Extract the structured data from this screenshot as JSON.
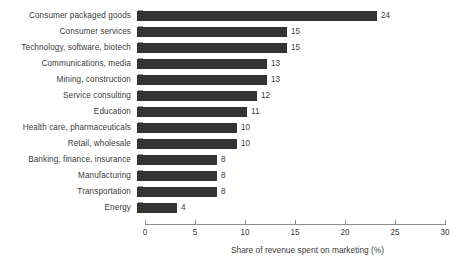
{
  "chart_data": {
    "type": "bar",
    "orientation": "horizontal",
    "title": "",
    "xlabel": "Share of revenue spent on marketing (%)",
    "ylabel": "",
    "xlim": [
      0,
      30
    ],
    "xticks": [
      0,
      5,
      10,
      15,
      20,
      25,
      30
    ],
    "grid": false,
    "legend": false,
    "bar_color": "#343434",
    "axis_color": "#8d8d8d",
    "text_color": "#3b3b3b",
    "background": "#ffffff",
    "categories": [
      "Consumer packaged goods",
      "Consumer services",
      "Technology, software, biotech",
      "Communications, media",
      "Mining, construction",
      "Service consulting",
      "Education",
      "Health care, pharmaceuticals",
      "Retail, wholesale",
      "Banking, finance, insurance",
      "Manufacturing",
      "Transportation",
      "Energy"
    ],
    "values": [
      24,
      15,
      15,
      13,
      13,
      12,
      11,
      10,
      10,
      8,
      8,
      8,
      4
    ],
    "value_labels": [
      "24",
      "15",
      "15",
      "13",
      "13",
      "12",
      "11",
      "10",
      "10",
      "8",
      "8",
      "8",
      "4"
    ],
    "xtick_labels": [
      "0",
      "5",
      "10",
      "15",
      "20",
      "25",
      "30"
    ]
  }
}
